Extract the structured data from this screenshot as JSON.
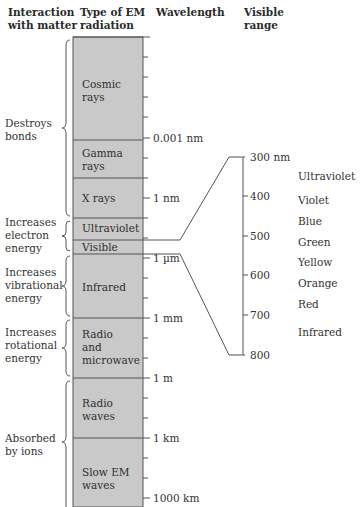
{
  "headers": {
    "interaction": [
      "Interaction",
      "with matter"
    ],
    "type": [
      "Type of EM",
      "radiation"
    ],
    "wavelength": "Wavelength",
    "visible": [
      "Visible",
      "range"
    ]
  },
  "interactions": [
    {
      "lines": [
        "Destroys",
        "bonds"
      ]
    },
    {
      "lines": [
        "Increases",
        "electron",
        "energy"
      ]
    },
    {
      "lines": [
        "Increases",
        "vibrational",
        "energy"
      ]
    },
    {
      "lines": [
        "Increases",
        "rotational",
        "energy"
      ]
    },
    {
      "lines": [
        "Absorbed",
        "by ions"
      ]
    }
  ],
  "bands": [
    {
      "lines": [
        "Cosmic",
        "rays"
      ]
    },
    {
      "lines": [
        "Gamma",
        "rays"
      ]
    },
    {
      "lines": [
        "X rays"
      ]
    },
    {
      "lines": [
        "Ultraviolet"
      ]
    },
    {
      "lines": [
        "Visible"
      ]
    },
    {
      "lines": [
        "Infrared"
      ]
    },
    {
      "lines": [
        "Radio",
        "and",
        "microwave"
      ]
    },
    {
      "lines": [
        "Radio",
        "waves"
      ]
    },
    {
      "lines": [
        "Slow EM",
        "waves"
      ]
    }
  ],
  "wavelength_labels": [
    "0.001 nm",
    "1 nm",
    "1 µm",
    "1 mm",
    "1 m",
    "1 km",
    "1000 km"
  ],
  "visible_scale": [
    "300 nm",
    "400",
    "500",
    "600",
    "700",
    "800"
  ],
  "visible_colors": [
    "Ultraviolet",
    "Violet",
    "Blue",
    "Green",
    "Yellow",
    "Orange",
    "Red",
    "Infrared"
  ],
  "colors": {
    "bar_fill": "#c9c9c9",
    "line": "#444444"
  }
}
